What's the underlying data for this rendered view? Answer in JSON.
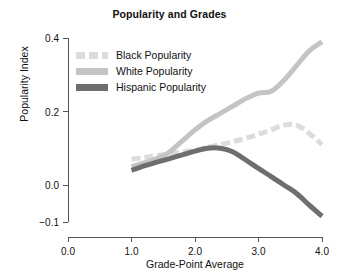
{
  "chart_data": {
    "type": "line",
    "title": "Popularity and Grades",
    "xlabel": "Grade-Point Average",
    "ylabel": "Popularity Index",
    "xlim": [
      0.0,
      4.0
    ],
    "ylim": [
      -0.1,
      0.4
    ],
    "xticks": [
      "0.0",
      "1.0",
      "2.0",
      "3.0",
      "4.0"
    ],
    "xtick_values": [
      0.0,
      1.0,
      2.0,
      3.0,
      4.0
    ],
    "yticks": [
      "0.4",
      "0.2",
      "0.0",
      "−0.1"
    ],
    "ytick_values": [
      0.4,
      0.2,
      0.0,
      -0.1
    ],
    "grid": false,
    "legend_position": "upper-left-inside",
    "x": [
      1.0,
      1.2,
      1.4,
      1.6,
      1.8,
      2.0,
      2.2,
      2.4,
      2.6,
      2.8,
      3.0,
      3.2,
      3.4,
      3.6,
      3.8,
      4.0
    ],
    "series": [
      {
        "name": "Black Popularity",
        "style": "dashed",
        "color": "#dcdcdc",
        "values": [
          0.07,
          0.075,
          0.08,
          0.085,
          0.09,
          0.095,
          0.103,
          0.11,
          0.118,
          0.127,
          0.138,
          0.15,
          0.163,
          0.163,
          0.14,
          0.11
        ]
      },
      {
        "name": "White Popularity",
        "style": "solid",
        "color": "#c4c4c4",
        "values": [
          0.05,
          0.06,
          0.072,
          0.09,
          0.12,
          0.15,
          0.175,
          0.195,
          0.215,
          0.235,
          0.25,
          0.255,
          0.285,
          0.325,
          0.365,
          0.39
        ]
      },
      {
        "name": "Hispanic Popularity",
        "style": "solid",
        "color": "#6e6e6e",
        "values": [
          0.04,
          0.052,
          0.062,
          0.072,
          0.082,
          0.092,
          0.1,
          0.1,
          0.09,
          0.068,
          0.045,
          0.023,
          0.0,
          -0.023,
          -0.055,
          -0.085
        ]
      }
    ]
  },
  "legend": {
    "items": [
      {
        "label": "Black Popularity",
        "color": "#dcdcdc",
        "style": "dashed"
      },
      {
        "label": "White Popularity",
        "color": "#c4c4c4",
        "style": "solid"
      },
      {
        "label": "Hispanic Popularity",
        "color": "#6e6e6e",
        "style": "solid"
      }
    ]
  },
  "axis_color": "#555555"
}
